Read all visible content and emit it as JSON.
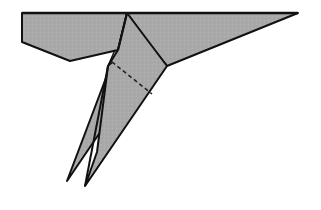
{
  "diagram": {
    "subject": "folded paper airplane, underside view",
    "fill_color": "#a8a8a8",
    "stroke_color": "#111111",
    "background": "#ffffff",
    "parts": [
      {
        "name": "left-wing",
        "points": "22,13 127,13 118,50 70,61 22,42"
      },
      {
        "name": "right-wing",
        "points": "127,13 298,13 167,66"
      },
      {
        "name": "body-right-panel",
        "points": "127,13 167,66 85,186 104,132 118,50"
      },
      {
        "name": "left-tail",
        "points": "118,50 112,62 67,181 104,132"
      },
      {
        "name": "right-tail-fold",
        "points": "104,132 85,186 95,160"
      }
    ],
    "lines": {
      "center_crease": "127,13 104,132",
      "dashed_fold": "112,62 151,93",
      "keel_line": "118,50 104,132"
    }
  }
}
